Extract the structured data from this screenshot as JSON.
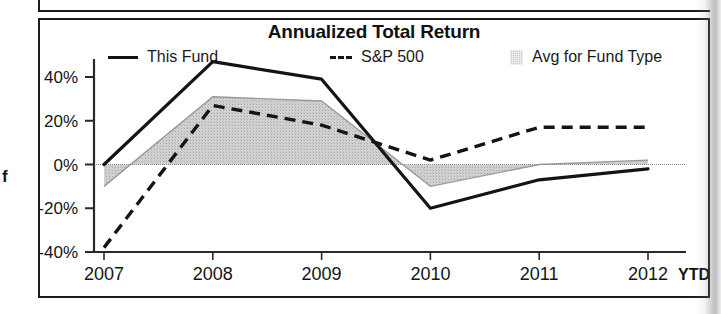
{
  "chart_data": {
    "type": "line",
    "title": "Annualized Total Return",
    "xlabel": "",
    "ylabel": "",
    "categories": [
      "2007",
      "2008",
      "2009",
      "2010",
      "2011",
      "2012"
    ],
    "x_axis_suffix_label": "YTD",
    "ytick_labels": [
      "40%",
      "20%",
      "0%",
      "-20%",
      "-40%"
    ],
    "ytick_values": [
      40,
      20,
      0,
      -20,
      -40
    ],
    "ylim": [
      -40,
      50
    ],
    "grid": false,
    "zero_line": true,
    "legend_position": "top",
    "series": [
      {
        "name": "This Fund",
        "style": "solid",
        "color": "#141414",
        "values": [
          0,
          47,
          39,
          -20,
          -7,
          -2
        ]
      },
      {
        "name": "S&P 500",
        "style": "dashed",
        "color": "#141414",
        "values": [
          -38,
          27,
          18,
          2,
          17,
          17
        ]
      },
      {
        "name": "Avg for Fund Type",
        "style": "shaded-band",
        "color": "#c9c9c9",
        "values": [
          -10,
          31,
          29,
          -10,
          0,
          2
        ]
      }
    ]
  },
  "legend": {
    "items": [
      {
        "label": "This Fund",
        "swatch": "solid-line-swatch"
      },
      {
        "label": "S&P 500",
        "swatch": "dashed-line-swatch"
      },
      {
        "label": "Avg for Fund Type",
        "swatch": "shaded-square-swatch"
      }
    ]
  },
  "margin": {
    "partial_glyph": "f"
  }
}
